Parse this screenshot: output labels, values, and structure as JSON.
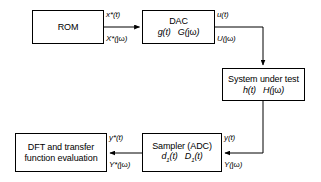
{
  "diagram": {
    "stroke_color": "#000000",
    "background_color": "#ffffff",
    "blocks": [
      {
        "id": "rom",
        "name": "rom-block",
        "line1": "ROM",
        "line2": ""
      },
      {
        "id": "dac",
        "name": "dac-block",
        "line1": "DAC",
        "line2_a": "g(t)",
        "line2_b": "G(",
        "line2_b_var": "jω",
        "line2_b_end": ")"
      },
      {
        "id": "system-under-test",
        "name": "system-under-test-block",
        "line1": "System under test",
        "line2_a": "h(t)",
        "line2_b": "H(",
        "line2_b_var": "jω",
        "line2_b_end": ")"
      },
      {
        "id": "sampler",
        "name": "sampler-adc-block",
        "line1": "Sampler (ADC)",
        "line2_a": "d",
        "line2_a_sub": "1",
        "line2_a_end": "(t)",
        "line2_b": "D",
        "line2_b_sub": "1",
        "line2_b_end": "(t)"
      },
      {
        "id": "dft",
        "name": "dft-transfer-function-block",
        "line1": "DFT and transfer",
        "line2": "function evaluation"
      }
    ],
    "signals": {
      "rom_out_time": "x*(t)",
      "rom_out_freq_a": "X*(",
      "rom_out_freq_b": "jω",
      "rom_out_freq_c": ")",
      "dac_out_time": "u(t)",
      "dac_out_freq_a": "U(",
      "dac_out_freq_b": "jω",
      "dac_out_freq_c": ")",
      "sut_out_time": "y(t)",
      "sut_out_freq_a": "Y(",
      "sut_out_freq_b": "jω",
      "sut_out_freq_c": ")",
      "sampler_out_time": "y*(t)",
      "sampler_out_freq_a": "Y*(",
      "sampler_out_freq_b": "jω",
      "sampler_out_freq_c": ")"
    }
  }
}
